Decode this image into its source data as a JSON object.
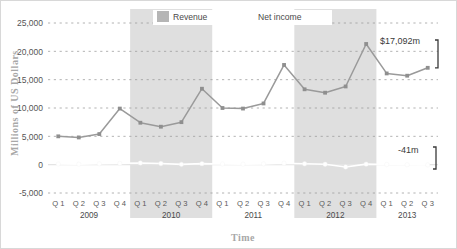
{
  "chart_data": {
    "type": "line",
    "title": "",
    "xlabel": "Time",
    "ylabel": "Millions of US Dollars",
    "ylim": [
      -5000,
      25000
    ],
    "ytick_labels": [
      "25,000",
      "20,000",
      "15,000",
      "10,000",
      "5,000",
      "0",
      "-5,000"
    ],
    "ytick_values": [
      25000,
      20000,
      15000,
      10000,
      5000,
      0,
      -5000
    ],
    "grid": true,
    "grid_style": "dotted-horizontal",
    "legend_position": "top-center",
    "x": [
      "Q 1",
      "Q 2",
      "Q 3",
      "Q 4",
      "Q 1",
      "Q 2",
      "Q 3",
      "Q 4",
      "Q 1",
      "Q 2",
      "Q 3",
      "Q 4",
      "Q 1",
      "Q 2",
      "Q 3",
      "Q 4",
      "Q 1",
      "Q 2",
      "Q 3"
    ],
    "year_groups": [
      {
        "label": "2009",
        "start": 0,
        "end": 3,
        "shaded": false
      },
      {
        "label": "2010",
        "start": 4,
        "end": 7,
        "shaded": true
      },
      {
        "label": "2011",
        "start": 8,
        "end": 11,
        "shaded": false
      },
      {
        "label": "2012",
        "start": 12,
        "end": 15,
        "shaded": true
      },
      {
        "label": "2013",
        "start": 16,
        "end": 18,
        "shaded": false
      }
    ],
    "series": [
      {
        "name": "Revenue",
        "color": "#9a9a9a",
        "marker_color": "#8f8f8f",
        "values": [
          5000,
          4800,
          5400,
          9900,
          7400,
          6700,
          7500,
          13400,
          10000,
          9900,
          10800,
          17600,
          13300,
          12700,
          13800,
          21300,
          16100,
          15700,
          17092
        ]
      },
      {
        "name": "Net income",
        "color": "#ffffff",
        "marker_color": "#ffffff",
        "values": [
          120,
          90,
          150,
          230,
          300,
          200,
          60,
          180,
          120,
          90,
          140,
          260,
          150,
          80,
          -400,
          90,
          30,
          -20,
          -41
        ]
      }
    ],
    "annotations": [
      {
        "name": "revenue-end-annotation",
        "text": "$17,092m"
      },
      {
        "name": "net-income-end-annotation",
        "text": "-41m"
      }
    ]
  },
  "legend": {
    "items": [
      {
        "label": "Revenue",
        "swatch": "#b5b5b5"
      },
      {
        "label": "Net income",
        "swatch": "#ffffff"
      }
    ]
  },
  "colors": {
    "shaded_band": "#d6d6d6",
    "gridline": "#9a9a9a",
    "revenue_line": "#9a9a9a",
    "net_income_line": "#ffffff",
    "frame_border": "#d8d8d8",
    "axis_title": "#a8a8a8"
  }
}
